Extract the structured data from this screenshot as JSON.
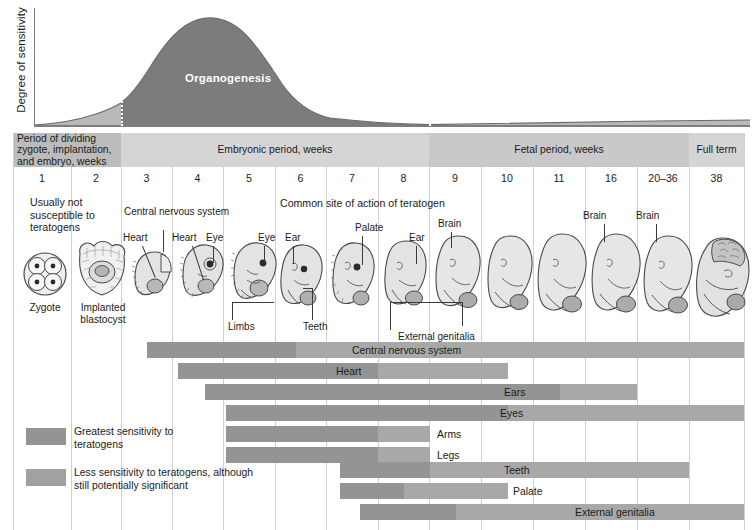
{
  "chart_data": {
    "type": "area",
    "ylabel": "Degree of sensitivity",
    "curve_label": "Organogenesis",
    "xlabel": "",
    "grid": true,
    "legend_position": "bottom-left",
    "categories": [
      "1",
      "2",
      "3",
      "4",
      "5",
      "6",
      "7",
      "8",
      "9",
      "10",
      "11",
      "16",
      "20–36",
      "38"
    ],
    "curve_description": "Sensitivity rises through weeks 2–4, peaks near week 4–5, then declines through the fetal period to term",
    "curve_points": [
      {
        "week": 1,
        "sensitivity": 0.02
      },
      {
        "week": 2,
        "sensitivity": 0.1
      },
      {
        "week": 3,
        "sensitivity": 0.52
      },
      {
        "week": 4,
        "sensitivity": 0.97
      },
      {
        "week": 5,
        "sensitivity": 0.88
      },
      {
        "week": 6,
        "sensitivity": 0.66
      },
      {
        "week": 7,
        "sensitivity": 0.44
      },
      {
        "week": 8,
        "sensitivity": 0.28
      },
      {
        "week": 9,
        "sensitivity": 0.16
      },
      {
        "week": 10,
        "sensitivity": 0.12
      },
      {
        "week": 11,
        "sensitivity": 0.1
      },
      {
        "week": 16,
        "sensitivity": 0.08
      },
      {
        "week": 24,
        "sensitivity": 0.07
      },
      {
        "week": 38,
        "sensitivity": 0.06
      }
    ],
    "series": [
      {
        "name": "Central nervous system",
        "start_week": 3,
        "high_end_week": 6,
        "end_week": 38
      },
      {
        "name": "Heart",
        "start_week": 3.5,
        "high_end_week": 6.5,
        "end_week": 9
      },
      {
        "name": "Ears",
        "start_week": 4.2,
        "high_end_week": 9.5,
        "end_week": 16
      },
      {
        "name": "Eyes",
        "start_week": 4.6,
        "high_end_week": 8.5,
        "end_week": 38
      },
      {
        "name": "Arms",
        "start_week": 4.6,
        "high_end_week": 7.5,
        "end_week": 8
      },
      {
        "name": "Legs",
        "start_week": 4.6,
        "high_end_week": 7.5,
        "end_week": 8
      },
      {
        "name": "Teeth",
        "start_week": 7,
        "high_end_week": 9,
        "end_week": 20
      },
      {
        "name": "Palate",
        "start_week": 7,
        "high_end_week": 8.5,
        "end_week": 9
      },
      {
        "name": "External genitalia",
        "start_week": 7.4,
        "high_end_week": 10,
        "end_week": 38
      }
    ]
  },
  "axis": {
    "label": "Degree of sensitivity"
  },
  "curve": {
    "organogenesis_label": "Organogenesis"
  },
  "periods": [
    {
      "id": "zygote",
      "label": "Period of dividing zygote, implantation, and embryo, weeks"
    },
    {
      "id": "embryonic",
      "label": "Embryonic period, weeks"
    },
    {
      "id": "fetal",
      "label": "Fetal period, weeks"
    },
    {
      "id": "fullterm",
      "label": "Full term"
    }
  ],
  "weeks": [
    {
      "label": "1"
    },
    {
      "label": "2"
    },
    {
      "label": "3"
    },
    {
      "label": "4"
    },
    {
      "label": "5"
    },
    {
      "label": "6"
    },
    {
      "label": "7"
    },
    {
      "label": "8"
    },
    {
      "label": "9"
    },
    {
      "label": "10"
    },
    {
      "label": "11"
    },
    {
      "label": "16"
    },
    {
      "label": "20–36"
    },
    {
      "label": "38"
    }
  ],
  "notes": {
    "usually_not": "Usually not susceptible to teratogens",
    "common_site": "Common site of action of teratogen"
  },
  "figures": {
    "zygote_caption": "Zygote",
    "blastocyst_caption": "Implanted blastocyst",
    "callouts": {
      "cns": "Central nervous system",
      "heart_w3": "Heart",
      "heart_w4": "Heart",
      "eye_w4": "Eye",
      "eye_w5": "Eye",
      "limbs": "Limbs",
      "ear_w6": "Ear",
      "teeth": "Teeth",
      "palate": "Palate",
      "ear_w8": "Ear",
      "brain_w9": "Brain",
      "external_genitalia": "External genitalia",
      "brain_w16": "Brain",
      "brain_w20": "Brain"
    }
  },
  "bars": [
    {
      "name": "Central nervous system",
      "label": "Central nervous system",
      "left": 147,
      "high_right": 296,
      "right": 744,
      "label_x": 352,
      "top": 4
    },
    {
      "name": "Heart",
      "label": "Heart",
      "left": 178,
      "high_right": 378,
      "right": 508,
      "label_x": 336,
      "top": 25
    },
    {
      "name": "Ears",
      "label": "Ears",
      "left": 205,
      "high_right": 560,
      "right": 637,
      "label_x": 504,
      "top": 46
    },
    {
      "name": "Eyes",
      "label": "Eyes",
      "left": 226,
      "high_right": 508,
      "right": 744,
      "label_x": 500,
      "top": 67
    },
    {
      "name": "Arms",
      "label": "Arms",
      "left": 226,
      "high_right": 378,
      "right": 430,
      "label_x": 437,
      "top": 88
    },
    {
      "name": "Legs",
      "label": "Legs",
      "left": 226,
      "high_right": 378,
      "right": 430,
      "label_x": 437,
      "top": 109
    },
    {
      "name": "Teeth",
      "label": "Teeth",
      "left": 340,
      "high_right": 430,
      "right": 689,
      "label_x": 504,
      "top": 124
    },
    {
      "name": "Palate",
      "label": "Palate",
      "left": 340,
      "high_right": 404,
      "right": 508,
      "label_x": 513,
      "top": 145
    },
    {
      "name": "External genitalia",
      "label": "External genitalia",
      "left": 360,
      "high_right": 456,
      "right": 744,
      "label_x": 575,
      "top": 166
    }
  ],
  "legend": [
    {
      "swatch": "high",
      "text": "Greatest sensitivity to teratogens"
    },
    {
      "swatch": "low",
      "text": "Less sensitivity to teratogens, although still potentially significant"
    }
  ],
  "colors": {
    "curve_dark": "#7c7c7c",
    "curve_light": "#b9b9b9",
    "bar_high": "#949494",
    "bar_low": "#a8a8a8",
    "band_zygote": "#bcbcbc",
    "band_embryonic": "#d5d5d5",
    "band_fetal": "#c9c9c9",
    "grid": "#d0d0d0"
  }
}
